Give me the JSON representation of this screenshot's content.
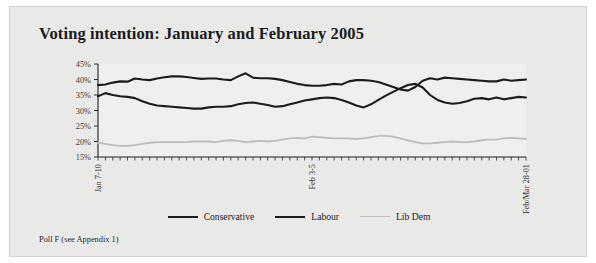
{
  "figure": {
    "title": "Voting intention: January and February 2005",
    "footnote": "Poll F (see Appendix 1)",
    "panel_color": "#e9e9e7",
    "plot_color": "#efefed"
  },
  "legend": {
    "position": "bottom-center",
    "entries": [
      {
        "label": "Conservative",
        "color": "#1c1c1c",
        "width": 2.1
      },
      {
        "label": "Labour",
        "color": "#1c1c1c",
        "width": 2.1
      },
      {
        "label": "Lib Dem",
        "color": "#bcbcbc",
        "width": 1.8
      }
    ]
  },
  "chart_data": {
    "type": "line",
    "title": "Voting intention: January and February 2005",
    "xlabel": "",
    "ylabel": "",
    "ylim": [
      15,
      45
    ],
    "yticks": [
      15,
      20,
      25,
      30,
      35,
      40,
      45
    ],
    "ytick_labels": [
      "15%",
      "20%",
      "25%",
      "30%",
      "35%",
      "40%",
      "45%"
    ],
    "grid": false,
    "xtick_labels": [
      "Jan 7-10",
      "Feb 3-5",
      "Feb/Mar 28-01"
    ],
    "xtick_positions": [
      0,
      29,
      58
    ],
    "n_points": 59,
    "series": [
      {
        "name": "Conservative",
        "color": "#1c1c1c",
        "values": [
          38.2,
          38.4,
          39.0,
          39.4,
          39.3,
          40.3,
          40.0,
          39.8,
          40.3,
          40.7,
          41.0,
          41.0,
          40.8,
          40.5,
          40.2,
          40.3,
          40.3,
          40.0,
          39.8,
          41.0,
          42.0,
          40.6,
          40.4,
          40.4,
          40.2,
          39.8,
          39.2,
          38.6,
          38.2,
          38.0,
          38.0,
          38.2,
          38.6,
          38.4,
          39.4,
          39.8,
          39.8,
          39.6,
          39.2,
          38.4,
          37.6,
          36.8,
          36.4,
          37.6,
          39.6,
          40.4,
          40.0,
          40.6,
          40.4,
          40.2,
          40.0,
          39.8,
          39.6,
          39.4,
          39.4,
          40.0,
          39.6,
          39.8,
          40.0
        ]
      },
      {
        "name": "Labour",
        "color": "#1c1c1c",
        "values": [
          34.6,
          35.6,
          35.0,
          34.6,
          34.4,
          34.0,
          33.0,
          32.2,
          31.6,
          31.4,
          31.2,
          31.0,
          30.8,
          30.6,
          30.6,
          31.0,
          31.2,
          31.2,
          31.4,
          32.0,
          32.4,
          32.6,
          32.2,
          31.8,
          31.2,
          31.4,
          32.0,
          32.6,
          33.2,
          33.6,
          34.0,
          34.2,
          34.0,
          33.4,
          32.6,
          31.6,
          31.0,
          32.0,
          33.4,
          34.8,
          36.0,
          37.2,
          38.2,
          38.6,
          37.4,
          35.0,
          33.4,
          32.6,
          32.2,
          32.4,
          33.0,
          33.8,
          34.0,
          33.6,
          34.2,
          33.6,
          34.0,
          34.4,
          34.2
        ]
      },
      {
        "name": "Lib Dem",
        "color": "#bcbcbc",
        "values": [
          19.6,
          19.2,
          18.8,
          18.6,
          18.6,
          18.8,
          19.2,
          19.6,
          19.8,
          19.8,
          19.8,
          19.8,
          19.8,
          20.0,
          20.0,
          20.0,
          19.8,
          20.2,
          20.4,
          20.2,
          19.8,
          20.0,
          20.2,
          20.0,
          20.2,
          20.6,
          21.0,
          21.2,
          21.0,
          21.6,
          21.4,
          21.2,
          21.0,
          21.0,
          21.0,
          20.8,
          21.0,
          21.4,
          21.8,
          21.8,
          21.6,
          21.0,
          20.4,
          19.8,
          19.4,
          19.4,
          19.6,
          19.8,
          20.0,
          19.8,
          19.8,
          20.0,
          20.4,
          20.6,
          20.6,
          21.0,
          21.2,
          21.0,
          20.8
        ]
      }
    ]
  }
}
